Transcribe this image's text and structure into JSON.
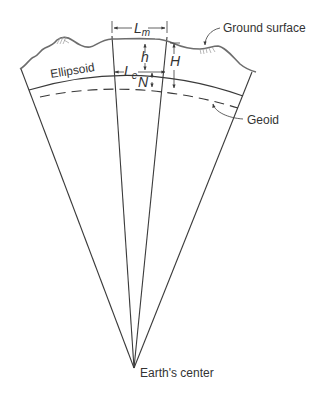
{
  "diagram": {
    "labels": {
      "ground_surface": "Ground surface",
      "ellipsoid": "Ellipsoid",
      "geoid": "Geoid",
      "earths_center": "Earth's center",
      "L_m": "L",
      "L_m_sub": "m",
      "L_e": "L",
      "L_e_sub": "e",
      "h": "h",
      "H": "H",
      "N": "N"
    },
    "colors": {
      "line": "#3a3a3a",
      "ground": "#6d6d6d",
      "text": "#333333",
      "background": "#ffffff"
    }
  }
}
